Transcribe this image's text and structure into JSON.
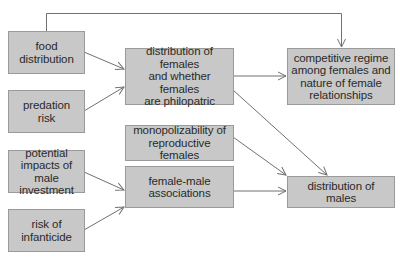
{
  "diagram": {
    "type": "flowchart",
    "colors": {
      "box_fill": "#c8c8c8",
      "box_border": "#9a9a9a",
      "line": "#707070",
      "text": "#2a2a2a"
    },
    "nodes": {
      "food_distribution": {
        "label": "food\ndistribution"
      },
      "predation_risk": {
        "label": "predation\nrisk"
      },
      "male_investment": {
        "label": "potential\nimpacts of\nmale investment"
      },
      "infanticide_risk": {
        "label": "risk of\ninfanticide"
      },
      "female_distribution": {
        "label": "distribution of females\nand whether females\nare philopatric"
      },
      "monopolizability": {
        "label": "monopolizability of\nreproductive females"
      },
      "female_male_associations": {
        "label": "female-male\nassociations"
      },
      "competitive_regime": {
        "label": "competitive regime\namong females and\nnature of female\nrelationships"
      },
      "male_distribution": {
        "label": "distribution of\nmales"
      }
    },
    "edges": [
      {
        "from": "food_distribution",
        "to": "female_distribution"
      },
      {
        "from": "predation_risk",
        "to": "female_distribution"
      },
      {
        "from": "food_distribution",
        "to": "competitive_regime"
      },
      {
        "from": "female_distribution",
        "to": "competitive_regime"
      },
      {
        "from": "female_distribution",
        "to": "male_distribution"
      },
      {
        "from": "monopolizability",
        "to": "male_distribution"
      },
      {
        "from": "male_investment",
        "to": "female_male_associations"
      },
      {
        "from": "infanticide_risk",
        "to": "female_male_associations"
      },
      {
        "from": "female_male_associations",
        "to": "male_distribution"
      }
    ]
  }
}
